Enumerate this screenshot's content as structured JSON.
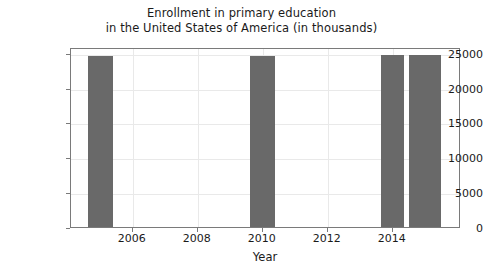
{
  "chart_data": {
    "type": "bar",
    "title": "Enrollment in primary education\nin the United States of America (in thousands)",
    "title_line1": "Enrollment in primary education",
    "title_line2": "in the United States of America (in thousands)",
    "xlabel": "Year",
    "ylabel": "",
    "x": [
      2005,
      2010,
      2014,
      2015
    ],
    "values": [
      24450,
      24500,
      24700,
      24700
    ],
    "bar_color": "#696969",
    "bar_widths_years": [
      0.78,
      0.78,
      0.72,
      0.98
    ],
    "xlim": [
      2004.1,
      2016.1
    ],
    "ylim": [
      0,
      25800
    ],
    "grid": true,
    "legend": null,
    "xticks": [
      2006,
      2008,
      2010,
      2012,
      2014
    ],
    "xtick_labels": [
      "2006",
      "2008",
      "2010",
      "2012",
      "2014"
    ],
    "yticks": [
      0,
      5000,
      10000,
      15000,
      20000,
      25000
    ],
    "ytick_labels": [
      "0",
      "5000",
      "10000",
      "15000",
      "20000",
      "25000"
    ]
  },
  "figure": {
    "background_color": "#ffffff",
    "axes_edge_color": "#7a7a7a",
    "grid_color": "#e9e9e9"
  }
}
